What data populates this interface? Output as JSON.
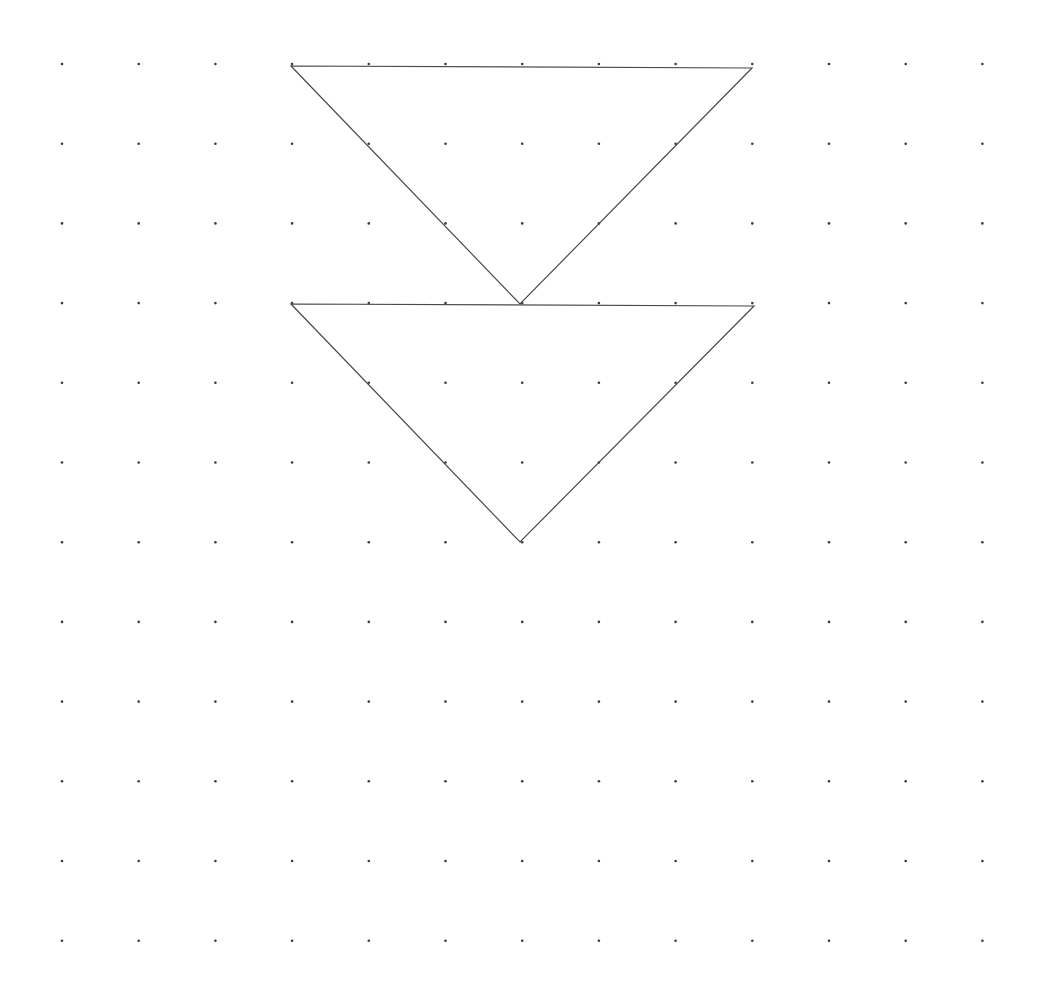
{
  "canvas": {
    "width": 1041,
    "height": 1005,
    "background_color": "#ffffff",
    "description": "dot-grid worksheet with two congruent downward-pointing triangles"
  },
  "grid": {
    "name": "dot-grid",
    "columns": 13,
    "rows": 12,
    "origin_x": 62,
    "origin_y": 64,
    "spacing_x": 76.7,
    "spacing_y": 79.7,
    "dot_radius": 1.3,
    "dot_color": "#3a3a40",
    "visible": true
  },
  "shapes": [
    {
      "name": "triangle-upper",
      "type": "triangle",
      "orientation": "pointing-down",
      "stroke_color": "#4a4a52",
      "stroke_width": 1.2,
      "fill": "none",
      "vertices": [
        {
          "label": "top-left",
          "x": 291,
          "y": 66,
          "grid_col": 3,
          "grid_row": 0
        },
        {
          "label": "top-right",
          "x": 752,
          "y": 68,
          "grid_col": 9,
          "grid_row": 0
        },
        {
          "label": "apex-bottom",
          "x": 520,
          "y": 304,
          "grid_col": 6,
          "grid_row": 3
        }
      ],
      "base_length_px": 461,
      "height_px": 238
    },
    {
      "name": "triangle-lower",
      "type": "triangle",
      "orientation": "pointing-down",
      "stroke_color": "#4a4a52",
      "stroke_width": 1.2,
      "fill": "none",
      "vertices": [
        {
          "label": "top-left",
          "x": 291,
          "y": 304,
          "grid_col": 3,
          "grid_row": 3
        },
        {
          "label": "top-right",
          "x": 754,
          "y": 306,
          "grid_col": 9,
          "grid_row": 3
        },
        {
          "label": "apex-bottom",
          "x": 520,
          "y": 542,
          "grid_col": 6,
          "grid_row": 6
        }
      ],
      "base_length_px": 463,
      "height_px": 238
    }
  ],
  "chart_data": {
    "type": "scatter",
    "title": "",
    "subtitle": "",
    "xlabel": "",
    "ylabel": "",
    "grid": true,
    "legend": "none",
    "xlim": [
      0,
      12
    ],
    "ylim": [
      0,
      11
    ],
    "annotations": [
      {
        "name": "triangle-upper",
        "points_grid": [
          [
            3,
            0
          ],
          [
            9,
            0
          ],
          [
            6,
            3
          ]
        ]
      },
      {
        "name": "triangle-lower",
        "points_grid": [
          [
            3,
            3
          ],
          [
            9,
            3
          ],
          [
            6,
            6
          ]
        ]
      }
    ],
    "x_tick_labels": [],
    "y_tick_labels": [],
    "series": [
      {
        "name": "grid-dots",
        "values": []
      }
    ]
  }
}
